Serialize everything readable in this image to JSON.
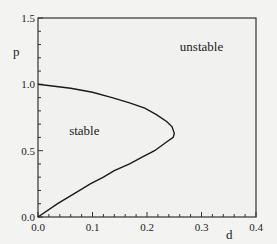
{
  "chart_data": {
    "type": "line",
    "title": "",
    "xlabel": "d",
    "ylabel": "p",
    "xlim": [
      0.0,
      0.4
    ],
    "ylim": [
      0.0,
      1.5
    ],
    "xticks": [
      "0.0",
      "0.1",
      "0.2",
      "0.3",
      "0.4"
    ],
    "yticks": [
      "0.0",
      "0.5",
      "1.0",
      "1.5"
    ],
    "grid": false,
    "annotations": [
      {
        "text": "stable",
        "x": 0.085,
        "y": 0.62
      },
      {
        "text": "unstable",
        "x": 0.3,
        "y": 1.25
      }
    ],
    "series": [
      {
        "name": "stability boundary",
        "x": [
          0.0,
          0.036,
          0.068,
          0.096,
          0.12,
          0.14,
          0.168,
          0.19,
          0.214,
          0.234,
          0.248,
          0.25,
          0.246,
          0.236,
          0.218,
          0.196,
          0.168,
          0.136,
          0.1,
          0.06,
          0.0
        ],
        "y": [
          0.0,
          0.1,
          0.18,
          0.25,
          0.3,
          0.35,
          0.4,
          0.45,
          0.5,
          0.56,
          0.6,
          0.63,
          0.68,
          0.72,
          0.77,
          0.82,
          0.86,
          0.9,
          0.94,
          0.97,
          1.0
        ]
      }
    ]
  }
}
